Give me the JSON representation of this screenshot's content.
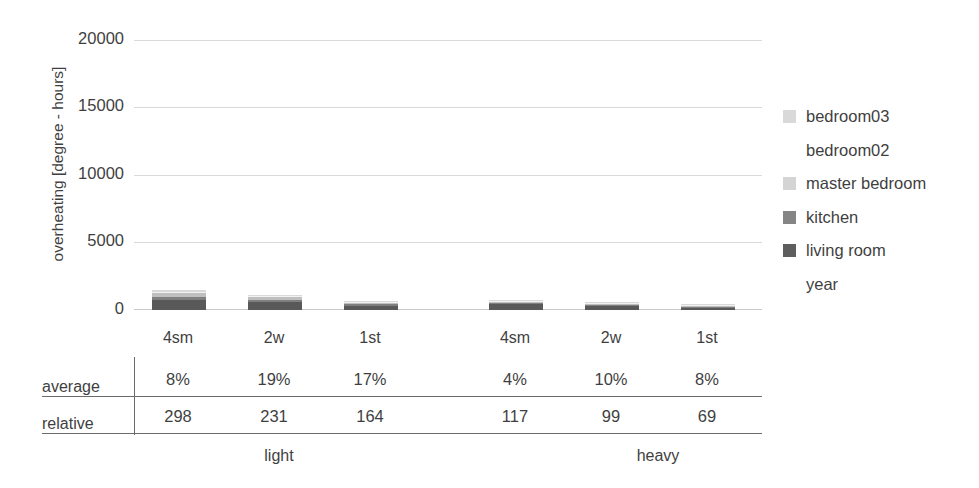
{
  "chart_data": {
    "type": "bar",
    "stacked": true,
    "title": "",
    "xlabel": "",
    "ylabel": "overheating [degree - hours]",
    "ylim": [
      0,
      20000
    ],
    "yticks": [
      0,
      5000,
      10000,
      15000,
      20000
    ],
    "ytick_labels": [
      "0",
      "5000",
      "10000",
      "15000",
      "20000"
    ],
    "grid": true,
    "legend_position": "right",
    "categories": [
      "4sm",
      "2w",
      "1st",
      "4sm",
      "2w",
      "1st"
    ],
    "groups": [
      {
        "label": "light",
        "categories": [
          "4sm",
          "2w",
          "1st"
        ]
      },
      {
        "label": "heavy",
        "categories": [
          "4sm",
          "2w",
          "1st"
        ]
      }
    ],
    "series": [
      {
        "name": "living room",
        "color": "#595959",
        "values": [
          760,
          560,
          330,
          430,
          330,
          180
        ]
      },
      {
        "name": "kitchen",
        "color": "#7f7f7f",
        "values": [
          230,
          170,
          90,
          110,
          80,
          40
        ]
      },
      {
        "name": "master bedroom",
        "color": "#bfbfbf",
        "values": [
          280,
          220,
          110,
          90,
          60,
          30
        ]
      },
      {
        "name": "bedroom02",
        "color": "#f2f2f2",
        "values": [
          90,
          60,
          40,
          30,
          20,
          10
        ]
      },
      {
        "name": "bedroom03",
        "color": "#d9d9d9",
        "values": [
          140,
          90,
          50,
          40,
          30,
          20
        ]
      },
      {
        "name": "year",
        "color": "#ffffff",
        "values": [
          0,
          0,
          0,
          0,
          0,
          0
        ]
      }
    ],
    "annotation_table": {
      "row_labels": [
        "average",
        "relative"
      ],
      "column_headers": [
        "4sm",
        "2w",
        "1st",
        "4sm",
        "2w",
        "1st"
      ],
      "rows": [
        {
          "label": "average",
          "values": [
            "8%",
            "19%",
            "17%",
            "4%",
            "10%",
            "8%"
          ]
        },
        {
          "label": "relative",
          "values": [
            "298",
            "231",
            "164",
            "117",
            "99",
            "69"
          ]
        }
      ]
    }
  },
  "legend": {
    "items": [
      {
        "label": "bedroom03",
        "color": "#d9d9d9",
        "swatch": "legend-swatch-bedroom03"
      },
      {
        "label": "bedroom02",
        "color": "#ffffff",
        "swatch": "legend-swatch-bedroom02"
      },
      {
        "label": "master bedroom",
        "color": "#d4d4d4",
        "swatch": "legend-swatch-master-bedroom"
      },
      {
        "label": "kitchen",
        "color": "#858585",
        "swatch": "legend-swatch-kitchen"
      },
      {
        "label": "living room",
        "color": "#5e5e5e",
        "swatch": "legend-swatch-living-room"
      },
      {
        "label": "year",
        "color": "#ffffff",
        "swatch": "legend-swatch-year"
      }
    ]
  },
  "axis": {
    "y_title": "overheating [degree - hours]"
  }
}
